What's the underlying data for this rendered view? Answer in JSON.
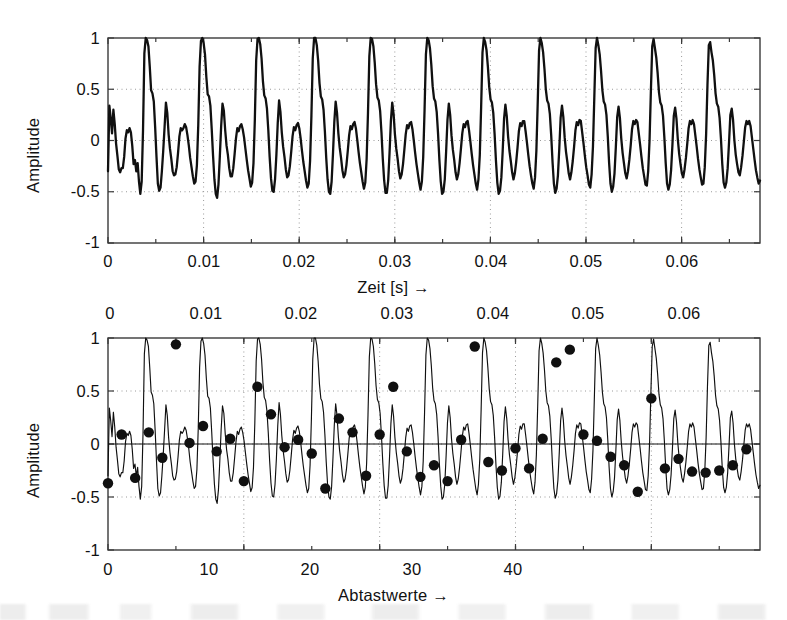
{
  "figure": {
    "background": "#ffffff",
    "line_color": "#101010",
    "marker_color": "#101010",
    "grid_color": "#9a9a9a",
    "axis_color": "#3a3a3a"
  },
  "panels": [
    {
      "id": "top",
      "ylabel": "Amplitude",
      "xlabel": "Zeit [s] →",
      "xlabel_position": "bottom",
      "xtick_position": "bottom",
      "ytick_labels": [
        "1",
        "0.5",
        "0",
        "-0.5",
        "-1"
      ],
      "ytick_values": [
        1,
        0.5,
        0,
        -0.5,
        -1
      ],
      "xtick_labels": [
        "0",
        "0.01",
        "0.02",
        "0.03",
        "0.04",
        "0.05",
        "0.06"
      ],
      "xtick_values": [
        0,
        0.01,
        0.02,
        0.03,
        0.04,
        0.05,
        0.06
      ],
      "xlim": [
        0,
        0.0682
      ],
      "ylim": [
        -1,
        1
      ],
      "grid": true
    },
    {
      "id": "bottom",
      "ylabel": "Amplitude",
      "xlabel": "Abtastwerte →",
      "xlabel_position": "bottom",
      "xtick_position": "bottom",
      "top_axis_labels": [
        "0",
        "0.01",
        "0.02",
        "0.03",
        "0.04",
        "0.05",
        "0.06"
      ],
      "top_axis_values": [
        0,
        0.01,
        0.02,
        0.03,
        0.04,
        0.05,
        0.06
      ],
      "ytick_labels": [
        "1",
        "0.5",
        "0",
        "-0.5",
        "-1"
      ],
      "ytick_values": [
        1,
        0.5,
        0,
        -0.5,
        -1
      ],
      "xtick_labels": [
        "0",
        "10",
        "20",
        "30",
        "40"
      ],
      "xtick_values": [
        0,
        10,
        20,
        30,
        40
      ],
      "xlim": [
        0,
        48
      ],
      "ylim": [
        -1,
        1
      ],
      "grid": true
    }
  ],
  "chart_data": [
    {
      "type": "line",
      "panel": "top",
      "title": "",
      "xlabel": "Zeit [s] →",
      "ylabel": "Amplitude",
      "xlim": [
        0,
        0.0682
      ],
      "ylim": [
        -1,
        1
      ],
      "grid": true,
      "legend": null,
      "series": [
        {
          "name": "Sprachsignal (kontinuierlich)",
          "sample_interval_s": 0.000142,
          "values": [
            -0.3,
            0.34,
            0.22,
            0.07,
            0.3,
            0.16,
            -0.03,
            -0.15,
            -0.28,
            -0.31,
            -0.27,
            -0.27,
            -0.16,
            0.02,
            0.1,
            0.08,
            0.12,
            0.08,
            -0.05,
            -0.23,
            -0.19,
            -0.3,
            -0.22,
            -0.4,
            -0.52,
            -0.4,
            0.1,
            0.85,
            1.0,
            0.98,
            0.92,
            0.72,
            0.49,
            0.46,
            0.38,
            0.13,
            -0.16,
            -0.42,
            -0.49,
            -0.46,
            -0.3,
            -0.1,
            0.13,
            0.37,
            0.27,
            0.06,
            -0.08,
            -0.18,
            -0.3,
            -0.34,
            -0.33,
            -0.26,
            -0.12,
            0.04,
            0.12,
            0.1,
            0.12,
            0.16,
            0.13,
            0.05,
            -0.05,
            -0.17,
            -0.26,
            -0.35,
            -0.42,
            -0.4,
            -0.24,
            0.15,
            0.72,
            0.97,
            1.0,
            0.95,
            0.84,
            0.62,
            0.45,
            0.43,
            0.34,
            0.11,
            -0.15,
            -0.38,
            -0.52,
            -0.56,
            -0.43,
            -0.16,
            0.14,
            0.36,
            0.29,
            0.1,
            -0.05,
            -0.14,
            -0.27,
            -0.35,
            -0.35,
            -0.27,
            -0.13,
            0.02,
            0.12,
            0.09,
            0.14,
            0.16,
            0.11,
            0.03,
            -0.08,
            -0.19,
            -0.29,
            -0.37,
            -0.45,
            -0.41,
            -0.22,
            0.2,
            0.78,
            0.99,
            1.0,
            0.94,
            0.8,
            0.58,
            0.44,
            0.41,
            0.31,
            0.1,
            -0.16,
            -0.37,
            -0.49,
            -0.5,
            -0.38,
            -0.14,
            0.17,
            0.39,
            0.28,
            0.08,
            -0.06,
            -0.16,
            -0.28,
            -0.36,
            -0.34,
            -0.25,
            -0.11,
            0.04,
            0.13,
            0.1,
            0.15,
            0.17,
            0.12,
            0.02,
            -0.1,
            -0.21,
            -0.3,
            -0.39,
            -0.46,
            -0.42,
            -0.2,
            0.24,
            0.8,
            1.0,
            1.0,
            0.93,
            0.78,
            0.56,
            0.43,
            0.4,
            0.3,
            0.09,
            -0.17,
            -0.38,
            -0.5,
            -0.52,
            -0.4,
            -0.13,
            0.18,
            0.38,
            0.27,
            0.07,
            -0.07,
            -0.17,
            -0.29,
            -0.36,
            -0.33,
            -0.24,
            -0.1,
            0.05,
            0.14,
            0.11,
            0.16,
            0.18,
            0.12,
            0.01,
            -0.11,
            -0.22,
            -0.31,
            -0.4,
            -0.47,
            -0.41,
            -0.18,
            0.27,
            0.82,
            1.0,
            0.99,
            0.92,
            0.76,
            0.55,
            0.42,
            0.39,
            0.29,
            0.08,
            -0.18,
            -0.39,
            -0.51,
            -0.51,
            -0.39,
            -0.12,
            0.19,
            0.37,
            0.26,
            0.06,
            -0.08,
            -0.18,
            -0.3,
            -0.37,
            -0.33,
            -0.23,
            -0.09,
            0.06,
            0.15,
            0.12,
            0.17,
            0.18,
            0.11,
            0.0,
            -0.12,
            -0.23,
            -0.32,
            -0.41,
            -0.48,
            -0.4,
            -0.16,
            0.3,
            0.84,
            1.0,
            0.98,
            0.9,
            0.74,
            0.53,
            0.41,
            0.38,
            0.28,
            0.07,
            -0.19,
            -0.4,
            -0.52,
            -0.5,
            -0.38,
            -0.11,
            0.2,
            0.36,
            0.25,
            0.05,
            -0.09,
            -0.19,
            -0.31,
            -0.38,
            -0.33,
            -0.22,
            -0.08,
            0.07,
            0.16,
            0.13,
            0.18,
            0.19,
            0.1,
            -0.01,
            -0.13,
            -0.24,
            -0.33,
            -0.42,
            -0.48,
            -0.38,
            -0.14,
            0.33,
            0.86,
            1.0,
            0.96,
            0.88,
            0.72,
            0.52,
            0.4,
            0.37,
            0.27,
            0.06,
            -0.2,
            -0.41,
            -0.52,
            -0.49,
            -0.36,
            -0.1,
            0.21,
            0.35,
            0.24,
            0.04,
            -0.1,
            -0.2,
            -0.31,
            -0.38,
            -0.32,
            -0.21,
            -0.07,
            0.09,
            0.17,
            0.14,
            0.19,
            0.19,
            0.09,
            -0.02,
            -0.14,
            -0.25,
            -0.34,
            -0.42,
            -0.47,
            -0.36,
            -0.1,
            0.37,
            0.88,
            1.0,
            0.95,
            0.86,
            0.7,
            0.5,
            0.39,
            0.36,
            0.26,
            0.05,
            -0.21,
            -0.42,
            -0.51,
            -0.47,
            -0.34,
            -0.08,
            0.22,
            0.34,
            0.23,
            0.03,
            -0.11,
            -0.21,
            -0.32,
            -0.38,
            -0.31,
            -0.2,
            -0.06,
            0.1,
            0.18,
            0.15,
            0.2,
            0.19,
            0.08,
            -0.03,
            -0.15,
            -0.26,
            -0.34,
            -0.43,
            -0.46,
            -0.33,
            -0.06,
            0.42,
            0.9,
            1.0,
            0.93,
            0.84,
            0.68,
            0.49,
            0.38,
            0.35,
            0.25,
            0.04,
            -0.22,
            -0.42,
            -0.5,
            -0.45,
            -0.32,
            -0.06,
            0.23,
            0.33,
            0.22,
            0.02,
            -0.12,
            -0.22,
            -0.32,
            -0.37,
            -0.3,
            -0.19,
            -0.05,
            0.11,
            0.19,
            0.16,
            0.2,
            0.18,
            0.07,
            -0.04,
            -0.16,
            -0.27,
            -0.35,
            -0.43,
            -0.44,
            -0.3,
            0.0,
            0.48,
            0.92,
            0.99,
            0.9,
            0.81,
            0.66,
            0.47,
            0.37,
            0.34,
            0.24,
            0.03,
            -0.22,
            -0.42,
            -0.48,
            -0.43,
            -0.29,
            -0.04,
            0.24,
            0.32,
            0.21,
            0.01,
            -0.13,
            -0.23,
            -0.32,
            -0.36,
            -0.28,
            -0.17,
            -0.03,
            0.12,
            0.19,
            0.16,
            0.2,
            0.16,
            0.05,
            -0.06,
            -0.18,
            -0.28,
            -0.36,
            -0.43,
            -0.42,
            -0.26,
            0.06,
            0.54,
            0.93,
            0.96,
            0.86,
            0.78,
            0.64,
            0.46,
            0.36,
            0.33,
            0.22,
            0.02,
            -0.23,
            -0.41,
            -0.46,
            -0.41,
            -0.27,
            -0.02,
            0.25,
            0.31,
            0.2,
            0.0,
            -0.14,
            -0.23,
            -0.31,
            -0.34,
            -0.26,
            -0.15,
            -0.01,
            0.13,
            0.19,
            0.16,
            0.19,
            0.14,
            0.03,
            -0.08,
            -0.19,
            -0.29,
            -0.36,
            -0.42,
            -0.39
          ]
        }
      ]
    },
    {
      "type": "line+scatter",
      "panel": "bottom",
      "title": "",
      "xlabel": "Abtastwerte →",
      "ylabel": "Amplitude",
      "xlim": [
        0,
        48
      ],
      "ylim": [
        -1,
        1
      ],
      "grid": true,
      "legend": null,
      "description": "Gleiches Sprachsignal mit markierten Abtastwerten (Punkte)",
      "sampled_points": {
        "x": [
          0,
          1,
          2,
          3,
          4,
          5,
          6,
          7,
          8,
          9,
          10,
          11,
          12,
          13,
          14,
          15,
          16,
          17,
          18,
          19,
          20,
          21,
          22,
          23,
          24,
          25,
          26,
          27,
          28,
          29,
          30,
          31,
          32,
          33,
          34,
          35,
          36,
          37,
          38,
          39,
          40,
          41,
          42,
          43,
          44,
          45,
          46,
          47
        ],
        "y": [
          -0.37,
          0.09,
          -0.32,
          0.11,
          -0.13,
          0.94,
          0.01,
          0.17,
          -0.07,
          0.05,
          -0.35,
          0.54,
          0.28,
          -0.03,
          0.04,
          -0.09,
          -0.42,
          0.24,
          0.11,
          -0.3,
          0.09,
          0.54,
          -0.07,
          -0.31,
          -0.2,
          -0.35,
          0.04,
          0.92,
          -0.17,
          -0.25,
          -0.04,
          -0.23,
          0.05,
          0.77,
          0.89,
          0.09,
          0.03,
          -0.12,
          -0.2,
          -0.45,
          0.43,
          -0.23,
          -0.14,
          -0.26,
          -0.27,
          -0.25,
          -0.2,
          -0.05
        ]
      },
      "series": [
        {
          "name": "Sprachsignal (kontinuierlich)",
          "note": "identisch zum oberen Panel"
        }
      ]
    }
  ]
}
